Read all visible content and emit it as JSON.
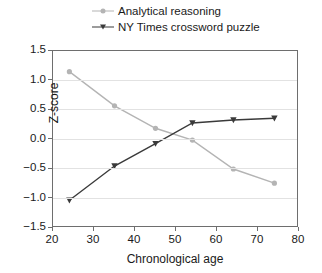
{
  "chart_data": {
    "type": "line",
    "title": "",
    "xlabel": "Chronological age",
    "ylabel": "Z-score",
    "x": [
      24,
      35,
      45,
      54,
      64,
      74
    ],
    "xlim": [
      20,
      80
    ],
    "ylim": [
      -1.5,
      1.5
    ],
    "xticks": [
      "20",
      "30",
      "40",
      "50",
      "60",
      "70",
      "80"
    ],
    "yticks": [
      "1.5",
      "1.0",
      "0.5",
      "0.0",
      "-0.5",
      "-1.0",
      "-1.5"
    ],
    "grid": "horizontal",
    "legend_position": "above-plot",
    "series": [
      {
        "name": "Analytical reasoning",
        "values": [
          1.15,
          0.57,
          0.19,
          -0.01,
          -0.5,
          -0.74
        ],
        "color": "#b4b4b4",
        "marker": "circle"
      },
      {
        "name": "NY Times crossword puzzle",
        "values": [
          -1.03,
          -0.45,
          -0.07,
          0.28,
          0.33,
          0.36
        ],
        "color": "#3a3a3a",
        "marker": "triangle-down"
      }
    ]
  },
  "legend": {
    "items": [
      {
        "label": "Analytical reasoning",
        "color": "#b4b4b4",
        "marker": "circle-marker-icon"
      },
      {
        "label": "NY Times crossword puzzle",
        "color": "#3a3a3a",
        "marker": "triangle-marker-icon"
      }
    ]
  },
  "axes": {
    "x_label": "Chronological age",
    "y_label": "Z-score",
    "x_ticks": [
      "20",
      "30",
      "40",
      "50",
      "60",
      "70",
      "80"
    ],
    "y_ticks": [
      "1.5",
      "1.0",
      "0.5",
      "0.0",
      "-0.5",
      "-1.0",
      "-1.5"
    ]
  }
}
